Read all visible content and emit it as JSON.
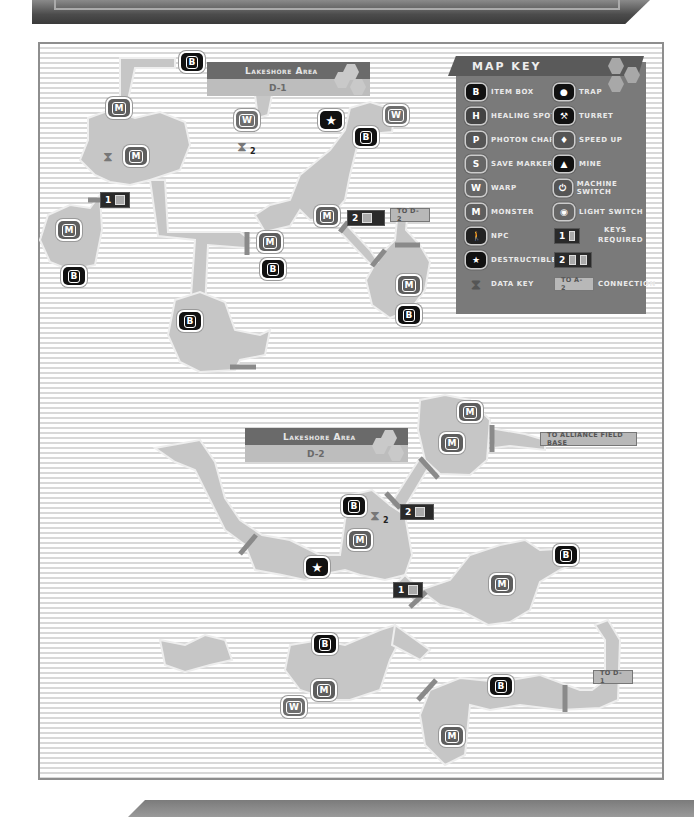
{
  "legend": {
    "title": "MAP KEY",
    "items": [
      {
        "icon": "item-box-icon",
        "glyph": "B",
        "label": "Item Box"
      },
      {
        "icon": "healing-spot-icon",
        "glyph": "H",
        "label": "Healing Spot"
      },
      {
        "icon": "photon-charge-icon",
        "glyph": "P",
        "label": "Photon Charge"
      },
      {
        "icon": "save-marker-icon",
        "glyph": "S",
        "label": "Save Marker"
      },
      {
        "icon": "warp-icon",
        "glyph": "W",
        "label": "Warp"
      },
      {
        "icon": "monster-icon",
        "glyph": "M",
        "label": "Monster"
      },
      {
        "icon": "npc-icon",
        "glyph": "🚶",
        "label": "NPC"
      },
      {
        "icon": "destructible-icon",
        "glyph": "★",
        "label": "Destructible"
      },
      {
        "icon": "data-key-icon",
        "glyph": "8",
        "label": "Data Key"
      },
      {
        "icon": "trap-icon",
        "glyph": "●",
        "label": "Trap"
      },
      {
        "icon": "turret-icon",
        "glyph": "⚒",
        "label": "Turret"
      },
      {
        "icon": "speed-up-icon",
        "glyph": "♦",
        "label": "Speed Up"
      },
      {
        "icon": "mine-icon",
        "glyph": "▲",
        "label": "Mine"
      },
      {
        "icon": "machine-switch-icon",
        "glyph": "⏻",
        "label": "Machine Switch"
      },
      {
        "icon": "light-switch-icon",
        "glyph": "◉",
        "label": "Light Switch"
      }
    ],
    "keys_required": {
      "label_line1": "Keys",
      "label_line2": "Required",
      "sample1": "1",
      "sample2": "2"
    },
    "connection": {
      "sample": "TO A-2",
      "label": "Connection"
    }
  },
  "maps": [
    {
      "area": "Lakeshore Area",
      "sector": "D-1",
      "connections": [
        {
          "label": "TO D-2"
        }
      ],
      "keys_required": [
        {
          "count": "1"
        },
        {
          "count": "2"
        }
      ],
      "data_keys": [
        {
          "count": ""
        },
        {
          "count": "2"
        }
      ]
    },
    {
      "area": "Lakeshore Area",
      "sector": "D-2",
      "connections": [
        {
          "label": "TO ALLIANCE FIELD BASE"
        },
        {
          "label": "TO D-1"
        }
      ],
      "keys_required": [
        {
          "count": "2"
        },
        {
          "count": "1"
        }
      ],
      "data_keys": [
        {
          "count": "2"
        }
      ]
    }
  ],
  "icon_glyphs": {
    "box": "B",
    "monster": "M",
    "warp": "W",
    "star": "★"
  },
  "colors": {
    "room": "#c6c6c6",
    "panel": "#7a7a7a",
    "header": "#5a5a5a",
    "door": "#8a8a8a",
    "box": "#111111",
    "monster": "#5e5e5e"
  }
}
